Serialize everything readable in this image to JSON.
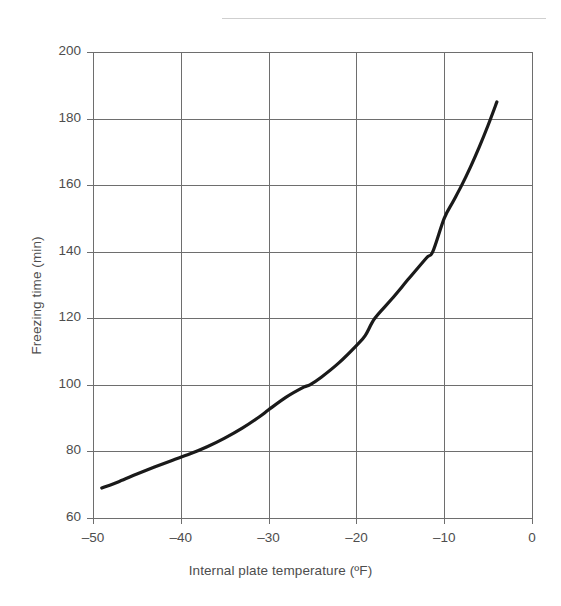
{
  "figure": {
    "background_color": "#ffffff",
    "top_rule_color": "#cfcfcf",
    "text_color": "#4d4d4d",
    "grid_color": "#6e6e6e",
    "curve_color": "#1a1a1a"
  },
  "chart_data": {
    "type": "line",
    "title": "",
    "subtitle": "",
    "xlabel": "Internal plate temperature (ºF)",
    "ylabel": "Freezing time (min)",
    "xlim": [
      -50,
      0
    ],
    "ylim": [
      60,
      200
    ],
    "xticks": [
      -50,
      -40,
      -30,
      -20,
      -10,
      0
    ],
    "xtick_labels": [
      "–50",
      "–40",
      "–30",
      "–20",
      "–10",
      "0"
    ],
    "yticks": [
      60,
      80,
      100,
      120,
      140,
      160,
      180,
      200
    ],
    "ytick_labels": [
      "60",
      "80",
      "100",
      "120",
      "140",
      "160",
      "180",
      "200"
    ],
    "grid": true,
    "grid_style": "solid",
    "legend": null,
    "legend_position": "none",
    "annotations": [],
    "series": [
      {
        "name": "Freezing time",
        "color": "#1a1a1a",
        "line_width": 3.2,
        "markers": false,
        "x": [
          -49.0,
          -47.0,
          -45.0,
          -43.0,
          -41.0,
          -39.0,
          -37.0,
          -35.0,
          -33.0,
          -31.0,
          -30.0,
          -28.0,
          -26.0,
          -25.3,
          -24.0,
          -22.0,
          -20.0,
          -19.0,
          -17.9,
          -16.0,
          -14.0,
          -12.0,
          -11.3,
          -10.0,
          -9.0,
          -8.0,
          -7.0,
          -6.0,
          -5.0,
          -4.0
        ],
        "y": [
          69.0,
          71.0,
          73.2,
          75.3,
          77.3,
          79.2,
          81.4,
          84.0,
          87.0,
          90.5,
          92.5,
          96.3,
          99.3,
          100.0,
          102.3,
          106.6,
          111.8,
          114.8,
          120.0,
          125.7,
          132.0,
          138.2,
          140.0,
          150.0,
          155.0,
          160.0,
          165.5,
          171.5,
          178.0,
          185.0
        ]
      }
    ]
  },
  "axes_geometry": {
    "plot_left_px": 93,
    "plot_right_px": 532,
    "plot_top_px": 52,
    "plot_bottom_px": 518
  }
}
